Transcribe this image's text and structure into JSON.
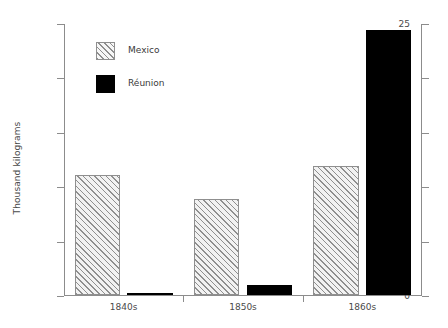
{
  "chart_data": {
    "type": "bar",
    "title": "",
    "xlabel": "",
    "ylabel": "Thousand kilograms",
    "categories": [
      "1840s",
      "1850s",
      "1860s"
    ],
    "series": [
      {
        "name": "Mexico",
        "values": [
          11.0,
          8.8,
          11.9
        ],
        "fill": "hatch",
        "color": "#8f8f8f"
      },
      {
        "name": "Réunion",
        "values": [
          0.15,
          0.9,
          24.4
        ],
        "fill": "solid",
        "color": "#000000"
      }
    ],
    "ylim": [
      0,
      25
    ],
    "yticks": [
      0,
      5,
      10,
      15,
      20,
      25
    ],
    "ytick_labels": [
      "0",
      "5",
      "10",
      "15",
      "20",
      "25"
    ],
    "grid": false,
    "legend_position": "upper-left-inside",
    "right_axis_ticks": true
  },
  "legend": {
    "items": [
      {
        "label": "Mexico"
      },
      {
        "label": "Réunion"
      }
    ]
  },
  "axis": {
    "y_title": "Thousand kilograms"
  }
}
